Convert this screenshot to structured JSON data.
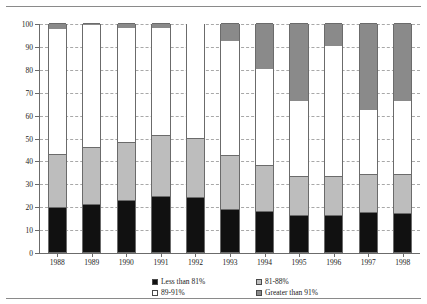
{
  "figure": {
    "y_axis_title": "Percent of Balance"
  },
  "legend": {
    "items": [
      {
        "label": "Less than 81%",
        "color": "#111111"
      },
      {
        "label": "81-88%",
        "color": "#bdbdbd"
      },
      {
        "label": "89-91%",
        "color": "#ffffff"
      },
      {
        "label": "Greater than 91%",
        "color": "#8a8a8a"
      }
    ]
  },
  "chart_data": {
    "type": "bar",
    "title": "",
    "xlabel": "",
    "ylabel": "Percent of Balance",
    "ylim": [
      0,
      100
    ],
    "yticks": [
      0,
      10,
      20,
      30,
      40,
      50,
      60,
      70,
      80,
      90,
      100
    ],
    "grid": true,
    "stacked": true,
    "legend_position": "bottom",
    "categories": [
      "1988",
      "1989",
      "1990",
      "1991",
      "1992",
      "1993",
      "1994",
      "1995",
      "1996",
      "1997",
      "1998"
    ],
    "series": [
      {
        "name": "Less than 81%",
        "color": "#111111",
        "values": [
          19.5,
          21.0,
          22.5,
          24.5,
          24.0,
          19.0,
          18.0,
          16.0,
          16.0,
          17.5,
          17.0
        ]
      },
      {
        "name": "81-88%",
        "color": "#bdbdbd",
        "values": [
          23.5,
          25.0,
          25.5,
          26.5,
          26.0,
          23.5,
          20.0,
          17.0,
          17.0,
          16.5,
          17.0
        ]
      },
      {
        "name": "89-91%",
        "color": "#ffffff",
        "values": [
          54.5,
          53.0,
          50.0,
          47.0,
          50.0,
          49.5,
          42.0,
          33.0,
          57.0,
          28.0,
          32.0
        ]
      },
      {
        "name": "Greater than 91%",
        "color": "#8a8a8a",
        "values": [
          2.5,
          1.0,
          2.0,
          2.0,
          0.0,
          8.0,
          20.0,
          34.0,
          10.0,
          38.0,
          34.0
        ]
      }
    ]
  }
}
